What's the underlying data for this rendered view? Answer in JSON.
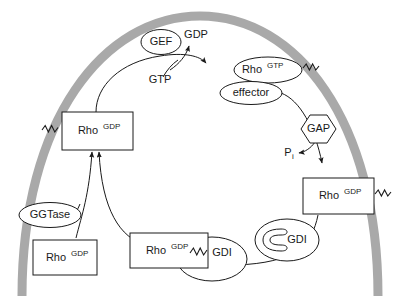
{
  "diagram": {
    "colors": {
      "membrane": "#a9a9a9",
      "stroke": "#1a1a1a",
      "node_fill": "#ffffff",
      "background": "#ffffff"
    }
  },
  "nodes": {
    "gef": {
      "label": "GEF",
      "shape": "ellipse"
    },
    "gap": {
      "label": "GAP",
      "shape": "hexagon"
    },
    "ggtase": {
      "label": "GGTase",
      "shape": "ellipse"
    },
    "gdi_free": {
      "label": "GDI",
      "shape": "crescent"
    },
    "gdi_bound": {
      "label": "GDI",
      "shape": "blob"
    },
    "effector": {
      "label": "effector",
      "shape": "ellipse"
    },
    "rho_gtp": {
      "base": "Rho",
      "sup": "GTP",
      "shape": "ellipse"
    },
    "rho_gdp_membrane_left": {
      "base": "Rho",
      "sup": "GDP",
      "shape": "rect"
    },
    "rho_gdp_membrane_right": {
      "base": "Rho",
      "sup": "GDP",
      "shape": "rect"
    },
    "rho_gdp_complex": {
      "base": "Rho",
      "sup": "GDP",
      "shape": "rect"
    },
    "rho_gdp_nascent": {
      "base": "Rho",
      "sup": "GDP",
      "shape": "rect"
    }
  },
  "small_labels": {
    "gdp_released": "GDP",
    "gtp_loaded": "GTP",
    "phosphate": {
      "base": "P",
      "sub": "i"
    }
  },
  "icons": {
    "prenyl_left": "zigzag-prenyl-icon",
    "prenyl_rho_gtp": "zigzag-prenyl-icon",
    "prenyl_right": "zigzag-prenyl-icon",
    "prenyl_complex": "zigzag-prenyl-icon",
    "membrane": "plasma-membrane-arc-icon"
  }
}
